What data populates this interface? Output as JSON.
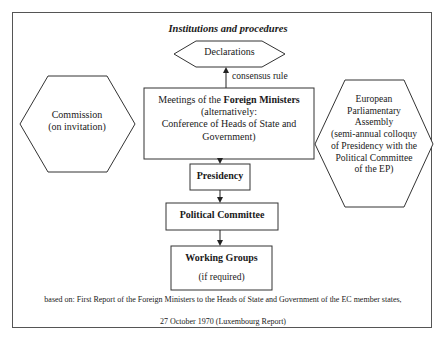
{
  "diagram": {
    "title": "Institutions and procedures",
    "nodes": {
      "declarations": {
        "label": "Declarations",
        "shape": "hexagon"
      },
      "meetings": {
        "label_prefix": "Meetings of the ",
        "label_bold": "Foreign Ministers",
        "label_line2": "(alternatively:",
        "label_line3": "Conference of Heads of State and",
        "label_line4": "Government)",
        "shape": "rectangle"
      },
      "commission": {
        "label_line1": "Commission",
        "label_line2": "(on invitation)",
        "shape": "hexagon"
      },
      "european_parliamentary_assembly": {
        "label_line1": "European",
        "label_line2": "Parliamentary",
        "label_line3": "Assembly",
        "label_line4": "(semi-annual colloquy",
        "label_line5": "of Presidency with the",
        "label_line6": "Political Committee",
        "label_line7": "of the EP)",
        "shape": "hexagon"
      },
      "presidency": {
        "label": "Presidency",
        "shape": "rectangle"
      },
      "political_committee": {
        "label": "Political Committee",
        "shape": "rectangle"
      },
      "working_groups": {
        "label": "Working Groups",
        "sublabel": "(if required)",
        "shape": "rectangle"
      }
    },
    "edges": [
      {
        "from": "meetings",
        "to": "declarations",
        "label": "consensus rule"
      },
      {
        "from": "meetings",
        "to": "presidency",
        "label": ""
      },
      {
        "from": "presidency",
        "to": "political_committee",
        "label": ""
      },
      {
        "from": "political_committee",
        "to": "working_groups",
        "label": ""
      }
    ],
    "source": {
      "line1": "based on: First Report of the Foreign Ministers to the Heads of State and Government of the EC member states,",
      "line2": "27 October 1970 (Luxembourg Report)"
    },
    "colors": {
      "stroke": "#333333",
      "frame": "#555555",
      "text": "#1a1a1a",
      "background": "#ffffff"
    }
  }
}
